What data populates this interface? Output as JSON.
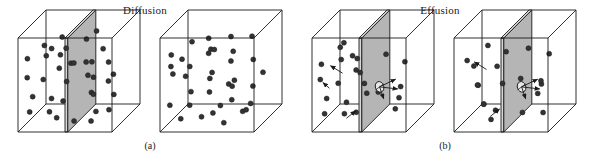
{
  "figure": {
    "background_color": "#ffffff",
    "line_color": "#1a1a1a",
    "molecule_color": "#333333",
    "barrier_fill": "#b5b5b5",
    "barrier_edge_fill": "#d8d8d8",
    "hole_fill": "#e8e8e8",
    "width": 596,
    "height": 162
  },
  "panels": [
    {
      "id": "diffusion",
      "title": "Diffusion",
      "caption": "(a)",
      "description": "Two cubes: the first divided by a solid partition with molecules on both sides, the second with the partition removed and molecules uniformly mixed."
    },
    {
      "id": "effusion",
      "title": "Effusion",
      "caption": "(b)",
      "description": "Two cubes each divided by a partition containing a small pinhole through which molecules escape; arrows show molecules streaming through the hole."
    }
  ],
  "cubes": [
    {
      "name": "diffusion-cube-left",
      "origin_x": 18,
      "origin_y": 38,
      "face": 94,
      "depth": 28,
      "barrier": {
        "present": true,
        "hole": false,
        "position": 0.5
      },
      "molecules": [
        [
          0.1,
          0.22
        ],
        [
          0.22,
          0.14
        ],
        [
          0.33,
          0.3
        ],
        [
          0.08,
          0.44
        ],
        [
          0.19,
          0.52
        ],
        [
          0.3,
          0.46
        ],
        [
          0.12,
          0.66
        ],
        [
          0.26,
          0.74
        ],
        [
          0.36,
          0.62
        ],
        [
          0.07,
          0.84
        ],
        [
          0.22,
          0.9
        ],
        [
          0.4,
          0.86
        ],
        [
          0.44,
          0.18
        ],
        [
          0.43,
          0.4
        ],
        [
          0.45,
          0.7
        ],
        [
          0.38,
          0.08
        ],
        [
          0.15,
          0.34
        ],
        [
          0.31,
          0.16
        ],
        [
          0.62,
          0.12
        ],
        [
          0.72,
          0.26
        ],
        [
          0.84,
          0.18
        ],
        [
          0.66,
          0.38
        ],
        [
          0.78,
          0.44
        ],
        [
          0.88,
          0.34
        ],
        [
          0.6,
          0.54
        ],
        [
          0.74,
          0.62
        ],
        [
          0.86,
          0.56
        ],
        [
          0.64,
          0.76
        ],
        [
          0.77,
          0.84
        ],
        [
          0.9,
          0.72
        ],
        [
          0.58,
          0.9
        ],
        [
          0.7,
          0.96
        ],
        [
          0.83,
          0.9
        ],
        [
          0.56,
          0.3
        ],
        [
          0.92,
          0.48
        ],
        [
          0.68,
          0.08
        ]
      ],
      "arrows": []
    },
    {
      "name": "diffusion-cube-right",
      "origin_x": 160,
      "origin_y": 38,
      "face": 94,
      "depth": 28,
      "barrier": {
        "present": false,
        "hole": false,
        "position": 0.5
      },
      "molecules": [
        [
          0.12,
          0.18
        ],
        [
          0.28,
          0.1
        ],
        [
          0.42,
          0.24
        ],
        [
          0.56,
          0.14
        ],
        [
          0.7,
          0.22
        ],
        [
          0.84,
          0.12
        ],
        [
          0.08,
          0.34
        ],
        [
          0.22,
          0.4
        ],
        [
          0.36,
          0.32
        ],
        [
          0.5,
          0.42
        ],
        [
          0.64,
          0.36
        ],
        [
          0.78,
          0.46
        ],
        [
          0.92,
          0.3
        ],
        [
          0.14,
          0.54
        ],
        [
          0.3,
          0.6
        ],
        [
          0.44,
          0.52
        ],
        [
          0.58,
          0.64
        ],
        [
          0.72,
          0.56
        ],
        [
          0.88,
          0.62
        ],
        [
          0.1,
          0.72
        ],
        [
          0.25,
          0.78
        ],
        [
          0.4,
          0.7
        ],
        [
          0.54,
          0.82
        ],
        [
          0.68,
          0.74
        ],
        [
          0.82,
          0.84
        ],
        [
          0.18,
          0.9
        ],
        [
          0.34,
          0.94
        ],
        [
          0.48,
          0.88
        ],
        [
          0.62,
          0.96
        ],
        [
          0.76,
          0.9
        ],
        [
          0.9,
          0.78
        ],
        [
          0.06,
          0.46
        ],
        [
          0.38,
          0.14
        ],
        [
          0.2,
          0.26
        ],
        [
          0.66,
          0.08
        ],
        [
          0.94,
          0.52
        ]
      ],
      "arrows": []
    },
    {
      "name": "effusion-cube-left",
      "origin_x": 312,
      "origin_y": 38,
      "face": 94,
      "depth": 28,
      "barrier": {
        "present": true,
        "hole": true,
        "position": 0.5
      },
      "molecules": [
        [
          0.1,
          0.28
        ],
        [
          0.24,
          0.16
        ],
        [
          0.36,
          0.34
        ],
        [
          0.07,
          0.46
        ],
        [
          0.2,
          0.56
        ],
        [
          0.33,
          0.48
        ],
        [
          0.12,
          0.68
        ],
        [
          0.27,
          0.78
        ],
        [
          0.4,
          0.64
        ],
        [
          0.08,
          0.86
        ],
        [
          0.23,
          0.92
        ],
        [
          0.42,
          0.2
        ],
        [
          0.44,
          0.44
        ],
        [
          0.45,
          0.72
        ],
        [
          0.31,
          0.08
        ],
        [
          0.38,
          0.88
        ],
        [
          0.16,
          0.38
        ],
        [
          0.74,
          0.22
        ],
        [
          0.88,
          0.36
        ],
        [
          0.7,
          0.58
        ],
        [
          0.86,
          0.7
        ],
        [
          0.76,
          0.88
        ],
        [
          0.92,
          0.54
        ]
      ],
      "arrows": [
        [
          0.26,
          0.44,
          0.13,
          0.36
        ],
        [
          0.3,
          0.92,
          0.4,
          0.84
        ],
        [
          0.12,
          0.6,
          0.05,
          0.54
        ]
      ]
    },
    {
      "name": "effusion-cube-right",
      "origin_x": 454,
      "origin_y": 38,
      "face": 94,
      "depth": 28,
      "barrier": {
        "present": true,
        "hole": true,
        "position": 0.5
      },
      "molecules": [
        [
          0.14,
          0.24
        ],
        [
          0.3,
          0.14
        ],
        [
          0.09,
          0.42
        ],
        [
          0.24,
          0.52
        ],
        [
          0.38,
          0.38
        ],
        [
          0.11,
          0.64
        ],
        [
          0.28,
          0.74
        ],
        [
          0.42,
          0.58
        ],
        [
          0.16,
          0.86
        ],
        [
          0.34,
          0.92
        ],
        [
          0.44,
          0.26
        ],
        [
          0.43,
          0.78
        ],
        [
          0.72,
          0.18
        ],
        [
          0.88,
          0.3
        ],
        [
          0.68,
          0.46
        ],
        [
          0.84,
          0.58
        ],
        [
          0.74,
          0.74
        ],
        [
          0.9,
          0.84
        ],
        [
          0.62,
          0.9
        ],
        [
          0.92,
          0.46
        ]
      ],
      "arrows": [
        [
          0.28,
          0.4,
          0.15,
          0.32
        ],
        [
          0.32,
          0.9,
          0.42,
          0.82
        ]
      ]
    }
  ],
  "hole_arrows": {
    "description": "Three arrows radiating from the pinhole into the right-hand compartment",
    "vectors": [
      [
        0.62,
        -0.3
      ],
      [
        0.7,
        0.08
      ],
      [
        0.16,
        0.46
      ]
    ]
  }
}
